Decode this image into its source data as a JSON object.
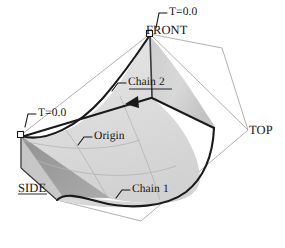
{
  "figure": {
    "background_color": "#ffffff",
    "ink_color": "#141414",
    "surface_light_color": "#dcdcdc",
    "surface_mid_color": "#c6c6c6",
    "surface_dark_color": "#9a9a9a",
    "wireframe_color": "#a8a8a8"
  },
  "labels": {
    "front": "FRONT",
    "top": "TOP",
    "side": "SIDE",
    "t_zero_top": "T=0.0",
    "t_zero_left": "T=0.0",
    "chain_two": "Chain 2",
    "chain_one": "Chain 1",
    "origin": "Origin"
  },
  "annotations": [
    {
      "name": "t-zero-top",
      "text": "T=0.0",
      "points_to": "front-apex-node"
    },
    {
      "name": "t-zero-left",
      "text": "T=0.0",
      "points_to": "left-start-node"
    },
    {
      "name": "chain-two",
      "text": "Chain 2",
      "points_to": "chain-2-curve"
    },
    {
      "name": "chain-one",
      "text": "Chain 1",
      "points_to": "chain-1-curve"
    },
    {
      "name": "origin",
      "text": "Origin",
      "points_to": "origin-edge"
    }
  ],
  "view_labels": [
    {
      "name": "front",
      "text": "FRONT"
    },
    {
      "name": "top",
      "text": "TOP"
    },
    {
      "name": "side",
      "text": "SIDE"
    }
  ],
  "nodes": [
    {
      "name": "front-apex-node",
      "x": 150,
      "y": 34
    },
    {
      "name": "left-start-node",
      "x": 21,
      "y": 135
    }
  ]
}
